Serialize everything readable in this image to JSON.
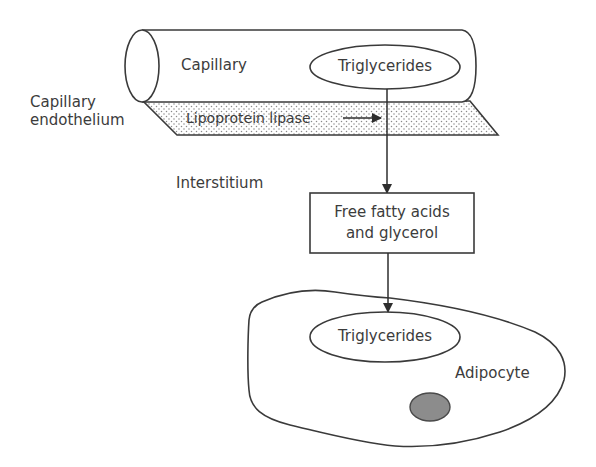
{
  "diagram": {
    "nodes": {
      "capillary": {
        "label": "Capillary"
      },
      "capillary_triglycerides": {
        "label": "Triglycerides"
      },
      "endothelium": {
        "label_line1": "Capillary",
        "label_line2": "endothelium"
      },
      "enzyme": {
        "label": "Lipoprotein lipase"
      },
      "interstitium": {
        "label": "Interstitium"
      },
      "products": {
        "label_line1": "Free fatty acids",
        "label_line2": "and glycerol"
      },
      "adipocyte": {
        "label": "Adipocyte"
      },
      "adipocyte_triglycerides": {
        "label": "Triglycerides"
      },
      "nucleus": {
        "label": ""
      }
    },
    "edges": [
      {
        "from": "capillary_triglycerides",
        "to": "products",
        "type": "arrow"
      },
      {
        "from": "products",
        "to": "adipocyte_triglycerides",
        "type": "arrow"
      },
      {
        "from": "enzyme",
        "to": "capillary_triglycerides_pathway",
        "type": "arrow"
      }
    ],
    "colors": {
      "stroke": "#3a3a3a",
      "text": "#3c3c3c",
      "dots": "#8a8a8a",
      "nucleus_fill": "#8c8c8c",
      "nucleus_stroke": "#4a4a4a"
    }
  }
}
